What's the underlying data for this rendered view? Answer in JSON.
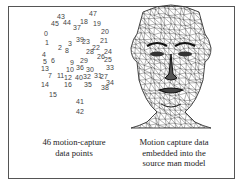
{
  "figure": {
    "left_panel": {
      "caption_line1": "46 motion-capture",
      "caption_line2": "data points",
      "points": [
        {
          "label": "43",
          "x": 57,
          "y": 13
        },
        {
          "label": "45",
          "x": 51,
          "y": 20
        },
        {
          "label": "44",
          "x": 63,
          "y": 19
        },
        {
          "label": "47",
          "x": 89,
          "y": 10
        },
        {
          "label": "18",
          "x": 80,
          "y": 18
        },
        {
          "label": "37",
          "x": 73,
          "y": 24
        },
        {
          "label": "19",
          "x": 93,
          "y": 20
        },
        {
          "label": "0",
          "x": 44,
          "y": 30
        },
        {
          "label": "20",
          "x": 101,
          "y": 28
        },
        {
          "label": "1",
          "x": 45,
          "y": 39
        },
        {
          "label": "3",
          "x": 68,
          "y": 40
        },
        {
          "label": "39",
          "x": 76,
          "y": 36
        },
        {
          "label": "23",
          "x": 82,
          "y": 38
        },
        {
          "label": "21",
          "x": 100,
          "y": 37
        },
        {
          "label": "2",
          "x": 58,
          "y": 44
        },
        {
          "label": "8",
          "x": 65,
          "y": 47
        },
        {
          "label": "22",
          "x": 92,
          "y": 44
        },
        {
          "label": "28",
          "x": 86,
          "y": 48
        },
        {
          "label": "24",
          "x": 104,
          "y": 48
        },
        {
          "label": "4",
          "x": 42,
          "y": 51
        },
        {
          "label": "26",
          "x": 97,
          "y": 53
        },
        {
          "label": "25",
          "x": 104,
          "y": 56
        },
        {
          "label": "5",
          "x": 43,
          "y": 58
        },
        {
          "label": "6",
          "x": 51,
          "y": 57
        },
        {
          "label": "9",
          "x": 70,
          "y": 59
        },
        {
          "label": "29",
          "x": 80,
          "y": 57
        },
        {
          "label": "13",
          "x": 41,
          "y": 65
        },
        {
          "label": "10",
          "x": 66,
          "y": 66
        },
        {
          "label": "36",
          "x": 76,
          "y": 64
        },
        {
          "label": "30",
          "x": 86,
          "y": 66
        },
        {
          "label": "33",
          "x": 106,
          "y": 64
        },
        {
          "label": "7",
          "x": 48,
          "y": 72
        },
        {
          "label": "11",
          "x": 57,
          "y": 72
        },
        {
          "label": "12",
          "x": 64,
          "y": 74
        },
        {
          "label": "40",
          "x": 75,
          "y": 74
        },
        {
          "label": "32",
          "x": 83,
          "y": 73
        },
        {
          "label": "31",
          "x": 94,
          "y": 72
        },
        {
          "label": "27",
          "x": 100,
          "y": 73
        },
        {
          "label": "14",
          "x": 41,
          "y": 81
        },
        {
          "label": "16",
          "x": 64,
          "y": 81
        },
        {
          "label": "35",
          "x": 84,
          "y": 81
        },
        {
          "label": "34",
          "x": 106,
          "y": 79
        },
        {
          "label": "38",
          "x": 101,
          "y": 84
        },
        {
          "label": "15",
          "x": 49,
          "y": 91
        },
        {
          "label": "41",
          "x": 76,
          "y": 98
        },
        {
          "label": "42",
          "x": 76,
          "y": 108
        }
      ]
    },
    "right_panel": {
      "caption_line1": "Motion capture data",
      "caption_line2": "embedded into the",
      "caption_line3": "source man model",
      "image_desc": "wireframe-face-mesh"
    }
  }
}
